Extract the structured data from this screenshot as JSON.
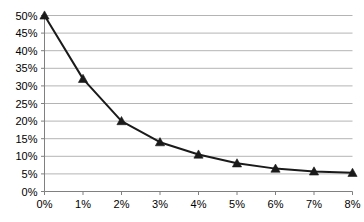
{
  "chart_data": {
    "type": "line",
    "title": "",
    "subtitle": "",
    "xlabel": "",
    "ylabel": "",
    "x": [
      0,
      1,
      2,
      3,
      4,
      5,
      6,
      7,
      8
    ],
    "x_tick_labels": [
      "0%",
      "1%",
      "2%",
      "3%",
      "4%",
      "5%",
      "6%",
      "7%",
      "8%"
    ],
    "y_tick_labels": [
      "0%",
      "5%",
      "10%",
      "15%",
      "20%",
      "25%",
      "30%",
      "35%",
      "40%",
      "45%",
      "50%"
    ],
    "y_ticks": [
      0,
      5,
      10,
      15,
      20,
      25,
      30,
      35,
      40,
      45,
      50
    ],
    "values": [
      50,
      32,
      20,
      14,
      10.5,
      8,
      6.5,
      5.7,
      5.3
    ],
    "xlim": [
      0,
      8
    ],
    "ylim": [
      0,
      50
    ],
    "grid": true,
    "grid_axis": "y",
    "legend": false,
    "legend_position": "none",
    "series": [
      {
        "name": "",
        "values": [
          50,
          32,
          20,
          14,
          10.5,
          8,
          6.5,
          5.7,
          5.3
        ],
        "marker": "triangle",
        "line_color": "#1a1a1a",
        "marker_color": "#1a1a1a"
      }
    ],
    "colors": {
      "line": "#1a1a1a",
      "marker": "#1a1a1a",
      "grid": "#b4b4b4",
      "axis": "#808080",
      "text": "#000000",
      "background": "#ffffff"
    }
  }
}
